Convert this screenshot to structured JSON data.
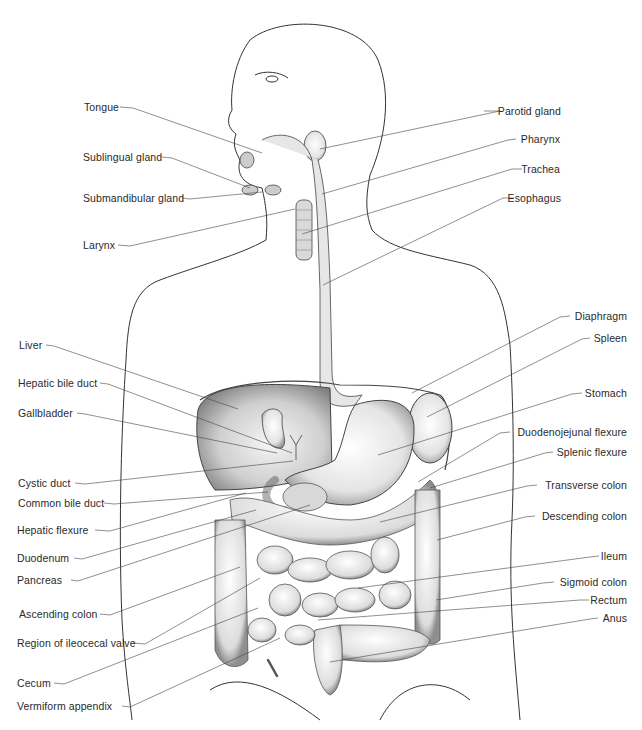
{
  "diagram": {
    "labels_left": [
      {
        "id": "tongue",
        "text": "Tongue",
        "x": 84,
        "y": 107
      },
      {
        "id": "sublingual-gland",
        "text": "Sublingual gland",
        "x": 83,
        "y": 157
      },
      {
        "id": "submandibular-gland",
        "text": "Submandibular gland",
        "x": 83,
        "y": 198
      },
      {
        "id": "larynx",
        "text": "Larynx",
        "x": 83,
        "y": 245
      },
      {
        "id": "liver",
        "text": "Liver",
        "x": 19,
        "y": 345
      },
      {
        "id": "hepatic-bile-duct",
        "text": "Hepatic bile duct",
        "x": 18,
        "y": 383
      },
      {
        "id": "gallbladder",
        "text": "Gallbladder",
        "x": 18,
        "y": 413
      },
      {
        "id": "cystic-duct",
        "text": "Cystic duct",
        "x": 18,
        "y": 483
      },
      {
        "id": "common-bile-duct",
        "text": "Common bile duct",
        "x": 18,
        "y": 503
      },
      {
        "id": "hepatic-flexure",
        "text": "Hepatic flexure",
        "x": 17,
        "y": 530
      },
      {
        "id": "duodenum",
        "text": "Duodenum",
        "x": 17,
        "y": 558
      },
      {
        "id": "pancreas",
        "text": "Pancreas",
        "x": 17,
        "y": 580
      },
      {
        "id": "ascending-colon",
        "text": "Ascending colon",
        "x": 19,
        "y": 614
      },
      {
        "id": "region-of-ileocecal-valve",
        "text": "Region of ileocecal valve",
        "x": 17,
        "y": 643
      },
      {
        "id": "cecum",
        "text": "Cecum",
        "x": 17,
        "y": 683
      },
      {
        "id": "vermiform-appendix",
        "text": "Vermiform appendix",
        "x": 17,
        "y": 706
      }
    ],
    "labels_right": [
      {
        "id": "parotid-gland",
        "text": "Parotid gland",
        "x": 561,
        "y": 111
      },
      {
        "id": "pharynx",
        "text": "Pharynx",
        "x": 560,
        "y": 139
      },
      {
        "id": "trachea",
        "text": "Trachea",
        "x": 560,
        "y": 169
      },
      {
        "id": "esophagus",
        "text": "Esophagus",
        "x": 561,
        "y": 198
      },
      {
        "id": "diaphragm",
        "text": "Diaphragm",
        "x": 627,
        "y": 316
      },
      {
        "id": "spleen",
        "text": "Spleen",
        "x": 627,
        "y": 338
      },
      {
        "id": "stomach",
        "text": "Stomach",
        "x": 627,
        "y": 393
      },
      {
        "id": "duodenojejunal-flexure",
        "text": "Duodenojejunal flexure",
        "x": 627,
        "y": 432
      },
      {
        "id": "splenic-flexure",
        "text": "Splenic flexure",
        "x": 627,
        "y": 452
      },
      {
        "id": "transverse-colon",
        "text": "Transverse colon",
        "x": 627,
        "y": 485
      },
      {
        "id": "descending-colon",
        "text": "Descending colon",
        "x": 627,
        "y": 516
      },
      {
        "id": "ileum",
        "text": "Ileum",
        "x": 627,
        "y": 556
      },
      {
        "id": "sigmoid-colon",
        "text": "Sigmoid colon",
        "x": 627,
        "y": 582
      },
      {
        "id": "rectum",
        "text": "Rectum",
        "x": 627,
        "y": 600
      },
      {
        "id": "anus",
        "text": "Anus",
        "x": 627,
        "y": 618
      }
    ]
  }
}
